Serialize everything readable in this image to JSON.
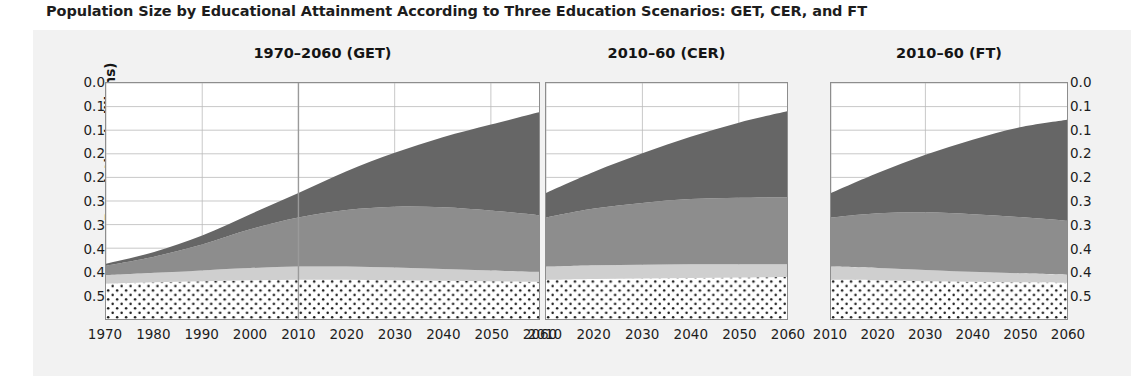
{
  "figure": {
    "title": "Population Size by Educational Attainment According to Three Education Scenarios: GET, CER, and FT",
    "y_axis_label": "Population (millions)"
  },
  "colors": {
    "background": "#ffffff",
    "panel_background": "#f2f2f2",
    "plot_background": "#ffffff",
    "grid": "#b9b9b9",
    "axis": "#8d8d8d",
    "layer_no_education": "#ffffff",
    "layer_no_education_dots": "#1a1a1a",
    "layer_primary": "#cfcfcf",
    "layer_secondary": "#8d8d8d",
    "layer_tertiary": "#666666",
    "projection_line": "#9a9a9a",
    "text": "#1d1d1d"
  },
  "chart_data": {
    "type": "area",
    "title": "Population Size by Educational Attainment According to Three Education Scenarios: GET, CER, and FT",
    "ylabel": "Population (millions)",
    "xlabel": "",
    "ylim": [
      0.0,
      0.5
    ],
    "grid": true,
    "stacked": true,
    "legend_position": "none",
    "y_ticks": [
      0.0,
      0.05,
      0.1,
      0.15,
      0.2,
      0.25,
      0.3,
      0.35,
      0.4,
      0.45,
      0.5
    ],
    "y_tick_labels": [
      "0.0",
      "0.1",
      "0.1",
      "0.2",
      "0.2",
      "0.3",
      "0.3",
      "0.4",
      "0.4",
      "0.5"
    ],
    "y_tick_labels_plotted": [
      0.05,
      0.1,
      0.15,
      0.2,
      0.25,
      0.3,
      0.35,
      0.4,
      0.45,
      0.5
    ],
    "panels": [
      {
        "id": "get",
        "title": "1970–2060 (GET)",
        "x": [
          1970,
          1980,
          1990,
          2000,
          2010,
          2020,
          2030,
          2040,
          2050,
          2060
        ],
        "x_tick_labels": [
          "1970",
          "1980",
          "1990",
          "2000",
          "2010",
          "2020",
          "2030",
          "2040",
          "2050",
          "2060"
        ],
        "projection_marker_year": 2010,
        "series": [
          {
            "name": "No education",
            "values": [
              0.075,
              0.078,
              0.08,
              0.082,
              0.083,
              0.083,
              0.082,
              0.081,
              0.08,
              0.079
            ]
          },
          {
            "name": "Primary",
            "values": [
              0.018,
              0.02,
              0.023,
              0.026,
              0.028,
              0.028,
              0.027,
              0.025,
              0.023,
              0.021
            ]
          },
          {
            "name": "Secondary",
            "values": [
              0.02,
              0.034,
              0.055,
              0.082,
              0.104,
              0.12,
              0.129,
              0.131,
              0.127,
              0.12
            ]
          },
          {
            "name": "Tertiary",
            "values": [
              0.004,
              0.01,
              0.019,
              0.032,
              0.052,
              0.082,
              0.114,
              0.148,
              0.182,
              0.218
            ]
          }
        ],
        "totals": [
          0.117,
          0.142,
          0.177,
          0.222,
          0.267,
          0.313,
          0.352,
          0.385,
          0.412,
          0.438
        ]
      },
      {
        "id": "cer",
        "title": "2010–60 (CER)",
        "x": [
          2010,
          2020,
          2030,
          2040,
          2050,
          2060
        ],
        "x_tick_labels": [
          "2010",
          "2020",
          "2030",
          "2040",
          "2050",
          "2060"
        ],
        "projection_marker_year": null,
        "series": [
          {
            "name": "No education",
            "values": [
              0.083,
              0.085,
              0.086,
              0.087,
              0.088,
              0.089
            ]
          },
          {
            "name": "Primary",
            "values": [
              0.028,
              0.029,
              0.029,
              0.029,
              0.028,
              0.027
            ]
          },
          {
            "name": "Secondary",
            "values": [
              0.104,
              0.12,
              0.131,
              0.138,
              0.141,
              0.142
            ]
          },
          {
            "name": "Tertiary",
            "values": [
              0.052,
              0.078,
              0.105,
              0.132,
              0.159,
              0.182
            ]
          }
        ],
        "totals": [
          0.267,
          0.312,
          0.351,
          0.386,
          0.416,
          0.44
        ]
      },
      {
        "id": "ft",
        "title": "2010–60 (FT)",
        "x": [
          2010,
          2020,
          2030,
          2040,
          2050,
          2060
        ],
        "x_tick_labels": [
          "2010",
          "2020",
          "2030",
          "2040",
          "2050",
          "2060"
        ],
        "projection_marker_year": null,
        "series": [
          {
            "name": "No education",
            "values": [
              0.083,
              0.082,
              0.08,
              0.079,
              0.078,
              0.077
            ]
          },
          {
            "name": "Primary",
            "values": [
              0.028,
              0.026,
              0.024,
              0.021,
              0.019,
              0.017
            ]
          },
          {
            "name": "Secondary",
            "values": [
              0.104,
              0.116,
              0.122,
              0.122,
              0.119,
              0.114
            ]
          },
          {
            "name": "Tertiary",
            "values": [
              0.052,
              0.086,
              0.122,
              0.158,
              0.19,
              0.214
            ]
          }
        ],
        "totals": [
          0.267,
          0.31,
          0.348,
          0.38,
          0.406,
          0.422
        ]
      }
    ]
  }
}
